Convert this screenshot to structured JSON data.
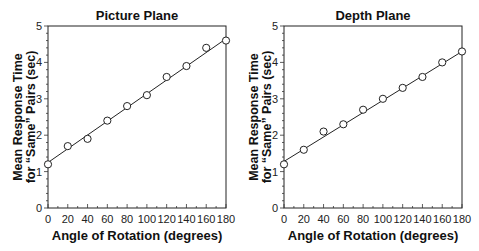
{
  "chart_data": [
    {
      "type": "scatter",
      "title": "Picture Plane",
      "xlabel": "Angle of Rotation (degrees)",
      "ylabel_line1": "Mean Response Time",
      "ylabel_line2": "for “Same” Pairs (sec)",
      "x": [
        0,
        20,
        40,
        60,
        80,
        100,
        120,
        140,
        160,
        180
      ],
      "values": [
        1.2,
        1.7,
        1.9,
        2.4,
        2.8,
        3.1,
        3.6,
        3.9,
        4.4,
        4.6
      ],
      "fit_line": {
        "x0": 0,
        "y0": 1.25,
        "x1": 180,
        "y1": 4.65
      },
      "xlim": [
        0,
        180
      ],
      "ylim": [
        0,
        5
      ],
      "xticks": [
        0,
        20,
        40,
        60,
        80,
        100,
        120,
        140,
        160,
        180
      ],
      "yticks": [
        0,
        1,
        2,
        3,
        4,
        5
      ],
      "grid": false,
      "marker": "open-circle"
    },
    {
      "type": "scatter",
      "title": "Depth Plane",
      "xlabel": "Angle of Rotation (degrees)",
      "ylabel_line1": "Mean Response Time",
      "ylabel_line2": "for “Same” Pairs (sec)",
      "x": [
        0,
        20,
        40,
        60,
        80,
        100,
        120,
        140,
        160,
        180
      ],
      "values": [
        1.2,
        1.6,
        2.1,
        2.3,
        2.7,
        3.0,
        3.3,
        3.6,
        4.0,
        4.3
      ],
      "fit_line": {
        "x0": 0,
        "y0": 1.28,
        "x1": 180,
        "y1": 4.3
      },
      "xlim": [
        0,
        180
      ],
      "ylim": [
        0,
        5
      ],
      "xticks": [
        0,
        20,
        40,
        60,
        80,
        100,
        120,
        140,
        160,
        180
      ],
      "yticks": [
        0,
        1,
        2,
        3,
        4,
        5
      ],
      "grid": false,
      "marker": "open-circle"
    }
  ]
}
